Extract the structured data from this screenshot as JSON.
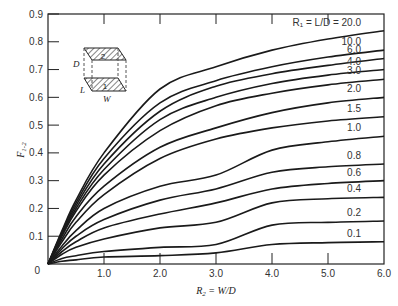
{
  "chart_data": {
    "type": "line",
    "title": "",
    "xlabel": "R2 = W/D",
    "ylabel": "F1-2",
    "xlim": [
      0,
      6.0
    ],
    "ylim": [
      0,
      0.9
    ],
    "grid": false,
    "x_ticks": [
      "0",
      "1.0",
      "2.0",
      "3.0",
      "4.0",
      "5.0",
      "6.0"
    ],
    "y_ticks": [
      "0.1",
      "0.2",
      "0.3",
      "0.4",
      "0.5",
      "0.6",
      "0.7",
      "0.8",
      "0.9"
    ],
    "legend_header": "R1 = L/D =",
    "x": [
      0,
      0.25,
      0.5,
      1.0,
      2.0,
      3.0,
      4.0,
      5.0,
      6.0
    ],
    "series": [
      {
        "name": "20.0",
        "values": [
          0,
          0.12,
          0.23,
          0.4,
          0.63,
          0.71,
          0.77,
          0.81,
          0.84
        ]
      },
      {
        "name": "10.0",
        "values": [
          0,
          0.115,
          0.22,
          0.38,
          0.58,
          0.66,
          0.71,
          0.745,
          0.77
        ]
      },
      {
        "name": "6.0",
        "values": [
          0,
          0.11,
          0.21,
          0.36,
          0.55,
          0.64,
          0.685,
          0.715,
          0.74
        ]
      },
      {
        "name": "4.0",
        "values": [
          0,
          0.105,
          0.2,
          0.34,
          0.52,
          0.6,
          0.65,
          0.68,
          0.7
        ]
      },
      {
        "name": "3.0",
        "values": [
          0,
          0.1,
          0.19,
          0.32,
          0.48,
          0.57,
          0.615,
          0.645,
          0.665
        ]
      },
      {
        "name": "2.0",
        "values": [
          0,
          0.09,
          0.17,
          0.28,
          0.42,
          0.49,
          0.545,
          0.58,
          0.6
        ]
      },
      {
        "name": "1.5",
        "values": [
          0,
          0.08,
          0.15,
          0.25,
          0.38,
          0.45,
          0.49,
          0.515,
          0.53
        ]
      },
      {
        "name": "1.0",
        "values": [
          0,
          0.065,
          0.12,
          0.2,
          0.28,
          0.32,
          0.41,
          0.44,
          0.46
        ]
      },
      {
        "name": "0.8",
        "values": [
          0,
          0.055,
          0.1,
          0.16,
          0.23,
          0.27,
          0.33,
          0.35,
          0.36
        ]
      },
      {
        "name": "0.6",
        "values": [
          0,
          0.045,
          0.08,
          0.13,
          0.18,
          0.22,
          0.27,
          0.29,
          0.3
        ]
      },
      {
        "name": "0.4",
        "values": [
          0,
          0.035,
          0.06,
          0.09,
          0.13,
          0.15,
          0.22,
          0.235,
          0.24
        ]
      },
      {
        "name": "0.2",
        "values": [
          0,
          0.02,
          0.03,
          0.045,
          0.06,
          0.07,
          0.14,
          0.15,
          0.155
        ]
      },
      {
        "name": "0.1",
        "values": [
          0,
          0.01,
          0.015,
          0.025,
          0.03,
          0.04,
          0.07,
          0.077,
          0.08
        ]
      }
    ],
    "inset": {
      "description": "Two parallel rectangles 1 and 2 separated by distance D",
      "labels": [
        "D",
        "L",
        "W",
        "1",
        "2"
      ]
    }
  },
  "labels": {
    "legend_header": "R₁ = L/D = 20.0",
    "ylabel_main": "F",
    "ylabel_sub": "1-2",
    "xlabel_main": "R",
    "xlabel_sub": "2",
    "xlabel_rest": " = W/D",
    "origin": "0"
  }
}
